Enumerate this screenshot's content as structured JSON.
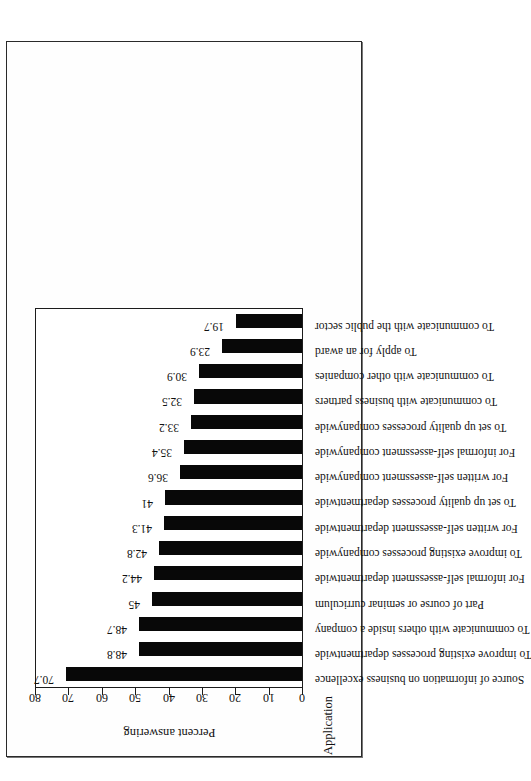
{
  "figure": {
    "frame_color": "#2a2a2a",
    "bar_color": "#080808",
    "background": "#ffffff"
  },
  "chart_data": {
    "type": "bar",
    "title": "",
    "xlabel": "Application",
    "ylabel": "Percent answering",
    "ylim": [
      0,
      80
    ],
    "yticks": [
      0,
      10,
      20,
      30,
      40,
      50,
      60,
      70,
      80
    ],
    "grid": false,
    "legend": null,
    "orientation": "vertical-bars-rotated-page",
    "categories": [
      "Source of information on business excellence",
      "To improve existing processes departmentwide",
      "To communicate with others inside a company",
      "Part of course or seminar curriculum",
      "For informal self-assessment departmentwide",
      "To improve existing processes companywide",
      "For written self-assessment departmentwide",
      "To set up quality processes departmentwide",
      "For written self-assessment companywide",
      "For informal self-assessment companywide",
      "To set up quality processes companywide",
      "To communicate with business partners",
      "To communicate with other companies",
      "To apply for an award",
      "To communicate with the public sector"
    ],
    "values": [
      70.7,
      48.8,
      48.7,
      45,
      44.2,
      42.8,
      41.3,
      41,
      36.6,
      35.4,
      33.2,
      32.5,
      30.9,
      23.9,
      19.7
    ],
    "value_labels": [
      "70.7",
      "48.8",
      "48.7",
      "45",
      "44.2",
      "42.8",
      "41.3",
      "41",
      "36.6",
      "35.4",
      "33.2",
      "32.5",
      "30.9",
      "23.9",
      "19.7"
    ]
  }
}
